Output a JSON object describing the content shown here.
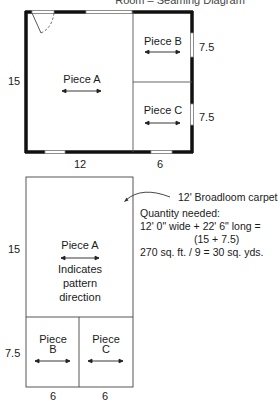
{
  "title": "Room – Seaming Diagram",
  "floor_plan": {
    "dimensions": {
      "left_height": "15",
      "right_top": "7.5",
      "right_bottom": "7.5",
      "bottom_left": "12",
      "bottom_right": "6"
    },
    "pieces": [
      {
        "id": "A",
        "label": "Piece A"
      },
      {
        "id": "B",
        "label": "Piece B"
      },
      {
        "id": "C",
        "label": "Piece C"
      }
    ]
  },
  "layout_plan": {
    "dimensions": {
      "left_top": "15",
      "left_bottom": "7.5",
      "bottom_left": "6",
      "bottom_right": "6"
    },
    "piece_a": {
      "label": "Piece A",
      "note_lines": [
        "Indicates",
        "pattern",
        "direction"
      ]
    },
    "piece_b": {
      "line1": "Piece",
      "line2": "B"
    },
    "piece_c": {
      "line1": "Piece",
      "line2": "C"
    }
  },
  "annotation": {
    "carpet": "12' Broadloom carpet",
    "quantity_heading": "Quantity needed:",
    "line1": "12' 0\" wide + 22' 6\" long =",
    "line2": "(15 + 7.5)",
    "line3": "270 sq. ft. / 9 = 30 sq. yds."
  }
}
